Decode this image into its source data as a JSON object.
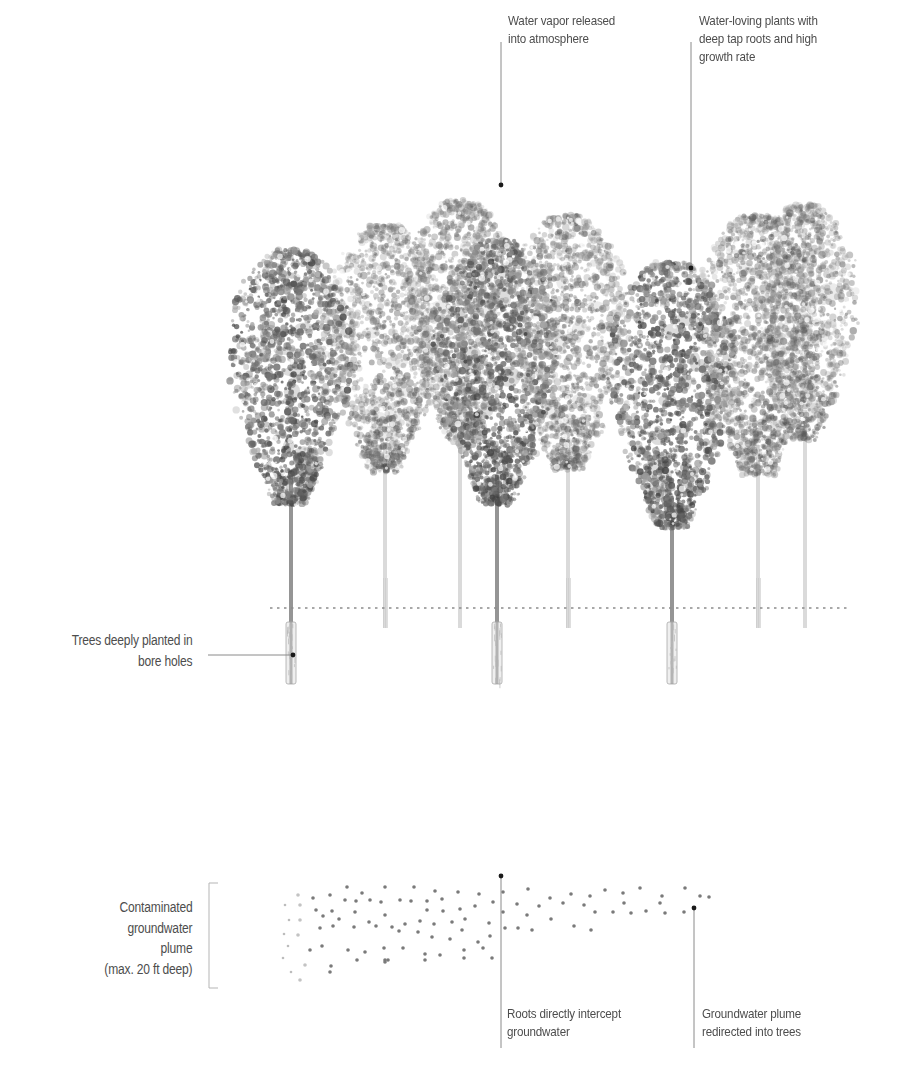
{
  "diagram": {
    "type": "phytoremediation-cross-section",
    "colors": {
      "background": "#ffffff",
      "text": "#4d4d4d",
      "leader_line": "#8a8a8a",
      "leader_dot": "#1a1a1a",
      "groundwater_dot": "#7a7a7a",
      "foliage_dark": "#3c3c3c",
      "foliage_light": "#9a9a9a",
      "ground_line": "#8c8c8c"
    },
    "labels": {
      "water_vapor": {
        "lines": [
          "Water vapor released",
          "into atmosphere"
        ]
      },
      "water_loving_plants": {
        "lines": [
          "Water-loving plants with",
          "deep tap roots and high",
          "growth rate"
        ]
      },
      "bore_holes": {
        "lines": [
          "Trees deeply planted in",
          "bore holes"
        ]
      },
      "plume": {
        "lines": [
          "Contaminated",
          "groundwater",
          "plume",
          "(max. 20 ft deep)"
        ]
      },
      "roots_intercept": {
        "lines": [
          "Roots directly intercept",
          "groundwater"
        ]
      },
      "plume_redirected": {
        "lines": [
          "Groundwater plume",
          "redirected into trees"
        ]
      }
    },
    "trees": {
      "foreground": [
        {
          "x": 291,
          "crown_top": 250,
          "crown_bottom": 505,
          "crown_half_width": 62
        },
        {
          "x": 497,
          "crown_top": 240,
          "crown_bottom": 505,
          "crown_half_width": 62
        },
        {
          "x": 672,
          "crown_top": 262,
          "crown_bottom": 528,
          "crown_half_width": 62
        }
      ],
      "background": [
        {
          "x": 385,
          "crown_top": 225,
          "crown_bottom": 472,
          "crown_half_width": 60
        },
        {
          "x": 568,
          "crown_top": 215,
          "crown_bottom": 470,
          "crown_half_width": 60
        },
        {
          "x": 758,
          "crown_top": 215,
          "crown_bottom": 475,
          "crown_half_width": 62
        },
        {
          "x": 460,
          "crown_top": 200,
          "crown_bottom": 440,
          "crown_half_width": 55
        },
        {
          "x": 805,
          "crown_top": 205,
          "crown_bottom": 440,
          "crown_half_width": 52
        }
      ],
      "bore_hole_top": 622,
      "bore_hole_bottom": 684
    },
    "ground_line": {
      "y": 608,
      "x1": 270,
      "x2": 850
    },
    "groundwater_dots": [
      [
        298,
        895
      ],
      [
        313,
        898
      ],
      [
        330,
        895
      ],
      [
        347,
        887
      ],
      [
        362,
        893
      ],
      [
        385,
        887
      ],
      [
        414,
        887
      ],
      [
        435,
        891
      ],
      [
        458,
        892
      ],
      [
        479,
        894
      ],
      [
        493,
        902
      ],
      [
        300,
        905
      ],
      [
        316,
        910
      ],
      [
        332,
        911
      ],
      [
        345,
        900
      ],
      [
        356,
        901
      ],
      [
        370,
        900
      ],
      [
        381,
        902
      ],
      [
        400,
        900
      ],
      [
        411,
        901
      ],
      [
        427,
        901
      ],
      [
        427,
        910
      ],
      [
        442,
        899
      ],
      [
        443,
        911
      ],
      [
        460,
        909
      ],
      [
        475,
        906
      ],
      [
        300,
        920
      ],
      [
        323,
        916
      ],
      [
        339,
        919
      ],
      [
        355,
        912
      ],
      [
        369,
        922
      ],
      [
        385,
        915
      ],
      [
        392,
        927
      ],
      [
        405,
        924
      ],
      [
        420,
        921
      ],
      [
        434,
        924
      ],
      [
        452,
        922
      ],
      [
        465,
        919
      ],
      [
        489,
        923
      ],
      [
        298,
        935
      ],
      [
        320,
        928
      ],
      [
        333,
        926
      ],
      [
        354,
        927
      ],
      [
        376,
        926
      ],
      [
        399,
        931
      ],
      [
        418,
        932
      ],
      [
        432,
        937
      ],
      [
        450,
        939
      ],
      [
        462,
        930
      ],
      [
        478,
        942
      ],
      [
        490,
        936
      ],
      [
        310,
        950
      ],
      [
        322,
        946
      ],
      [
        348,
        950
      ],
      [
        365,
        952
      ],
      [
        384,
        948
      ],
      [
        403,
        948
      ],
      [
        425,
        954
      ],
      [
        440,
        955
      ],
      [
        464,
        950
      ],
      [
        483,
        948
      ],
      [
        305,
        965
      ],
      [
        330,
        972
      ],
      [
        357,
        960
      ],
      [
        385,
        960
      ],
      [
        425,
        960
      ],
      [
        464,
        958
      ],
      [
        492,
        958
      ],
      [
        300,
        980
      ],
      [
        331,
        966
      ],
      [
        385,
        962
      ],
      [
        388,
        960
      ],
      [
        503,
        892
      ],
      [
        528,
        889
      ],
      [
        550,
        898
      ],
      [
        571,
        894
      ],
      [
        590,
        896
      ],
      [
        605,
        890
      ],
      [
        623,
        893
      ],
      [
        640,
        888
      ],
      [
        662,
        896
      ],
      [
        685,
        888
      ],
      [
        700,
        896
      ],
      [
        709,
        897
      ],
      [
        503,
        912
      ],
      [
        517,
        904
      ],
      [
        527,
        915
      ],
      [
        539,
        906
      ],
      [
        551,
        919
      ],
      [
        563,
        903
      ],
      [
        584,
        905
      ],
      [
        595,
        912
      ],
      [
        613,
        912
      ],
      [
        624,
        903
      ],
      [
        631,
        913
      ],
      [
        646,
        911
      ],
      [
        660,
        903
      ],
      [
        665,
        913
      ],
      [
        684,
        912
      ],
      [
        505,
        928
      ],
      [
        518,
        928
      ],
      [
        532,
        930
      ],
      [
        574,
        926
      ],
      [
        591,
        930
      ]
    ],
    "leader_lines": [
      {
        "id": "water_vapor",
        "x": 501,
        "y1": 42,
        "y2": 185,
        "dot": true
      },
      {
        "id": "water_loving_plants",
        "x": 691,
        "y1": 42,
        "y2": 268,
        "dot": true
      },
      {
        "id": "bore_holes",
        "x1": 208,
        "x2": 293,
        "y": 655,
        "dot": true
      },
      {
        "id": "roots_intercept",
        "x": 501,
        "y1": 876,
        "y2": 1048,
        "dot": true
      },
      {
        "id": "plume_redirected",
        "x": 694,
        "y1": 908,
        "y2": 1048,
        "dot": true
      }
    ]
  }
}
